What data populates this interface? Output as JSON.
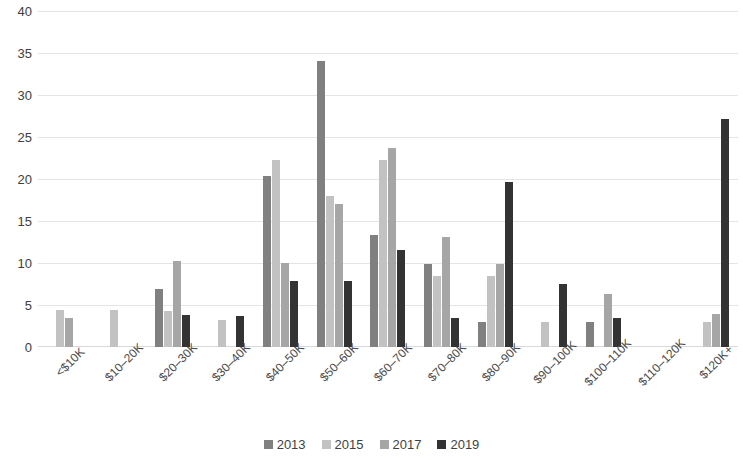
{
  "chart_data": {
    "type": "bar",
    "title": "",
    "subtitle": "",
    "xlabel": "",
    "ylabel": "",
    "ylim": [
      0,
      40
    ],
    "ytick_step": 5,
    "yticks": [
      40,
      35,
      30,
      25,
      20,
      15,
      10,
      5,
      0
    ],
    "grid": true,
    "legend_position": "bottom",
    "categories": [
      "<$10K",
      "$10–20K",
      "$20–30K",
      "$30–40K",
      "$40–50K",
      "$50–60K",
      "$60–70K",
      "$70–80K",
      "$80–90K",
      "$90–100K",
      "$100–110K",
      "$110–120K",
      "$120K+"
    ],
    "series": [
      {
        "name": "2013",
        "color": "#808080",
        "values": [
          0,
          0,
          6.9,
          0,
          20.4,
          34.0,
          13.3,
          9.9,
          3.0,
          0,
          3.0,
          0,
          0
        ]
      },
      {
        "name": "2015",
        "color": "#c2c2c2",
        "values": [
          4.4,
          4.4,
          4.3,
          3.2,
          22.3,
          18.0,
          22.3,
          8.4,
          8.4,
          3.0,
          0,
          0,
          3.0
        ]
      },
      {
        "name": "2017",
        "color": "#a6a6a6",
        "values": [
          3.4,
          0,
          10.2,
          0,
          10.0,
          17.0,
          23.7,
          13.1,
          9.9,
          0,
          6.3,
          0,
          3.9
        ]
      },
      {
        "name": "2019",
        "color": "#333333",
        "values": [
          0,
          0,
          3.8,
          3.7,
          7.8,
          7.8,
          11.5,
          3.5,
          19.6,
          7.5,
          3.4,
          0,
          27.2
        ]
      }
    ]
  },
  "legend": {
    "items": [
      {
        "label": "2013",
        "color": "#808080"
      },
      {
        "label": "2015",
        "color": "#c2c2c2"
      },
      {
        "label": "2017",
        "color": "#a6a6a6"
      },
      {
        "label": "2019",
        "color": "#333333"
      }
    ]
  },
  "colors": {
    "gridline": "#e4e4e4",
    "axis": "#d9d9d9",
    "text": "#404040",
    "background": "#ffffff"
  }
}
